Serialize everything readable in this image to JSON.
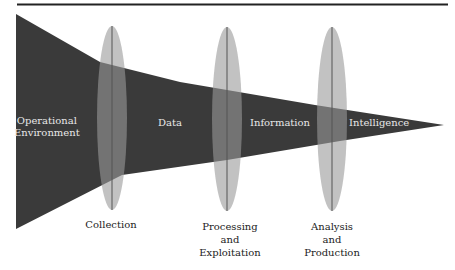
{
  "diagram": {
    "type": "funnel-with-lenses",
    "colors": {
      "funnel": "#3a3a3a",
      "lens": "#9a9a9a",
      "lens_line": "#555555",
      "rule": "#222222",
      "stage_text": "#e8e8e8",
      "process_text": "#222222"
    },
    "stages": [
      {
        "label": "Operational Environment"
      },
      {
        "label": "Data"
      },
      {
        "label": "Information"
      },
      {
        "label": "Intelligence"
      }
    ],
    "processes": [
      {
        "label_lines": [
          "Collection"
        ]
      },
      {
        "label_lines": [
          "Processing",
          "and",
          "Exploitation"
        ]
      },
      {
        "label_lines": [
          "Analysis",
          "and",
          "Production"
        ]
      }
    ]
  },
  "labels": {
    "stage0_line1": "Operational",
    "stage0_line2": "Environment",
    "stage1": "Data",
    "stage2": "Information",
    "stage3": "Intelligence",
    "proc0_line1": "Collection",
    "proc1_line1": "Processing",
    "proc1_line2": "and",
    "proc1_line3": "Exploitation",
    "proc2_line1": "Analysis",
    "proc2_line2": "and",
    "proc2_line3": "Production"
  }
}
